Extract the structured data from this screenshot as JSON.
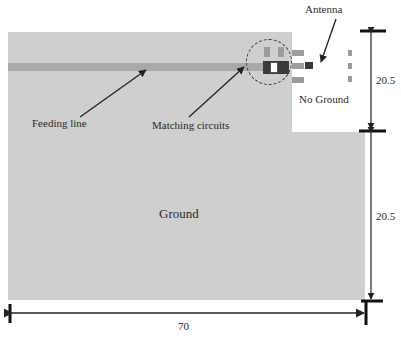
{
  "diagram": {
    "labels": {
      "antenna": "Antenna",
      "feeding_line": "Feeding line",
      "matching_circuits": "Matching circuits",
      "no_ground": "No Ground",
      "ground": "Ground"
    },
    "dimensions": {
      "width": "70",
      "upper_height": "20.5",
      "lower_height": "20.5"
    },
    "colors": {
      "ground": "#cfcfcf",
      "no_ground": "#ffffff",
      "feed_line": "#a9a9a9",
      "annotation": "#222222"
    }
  }
}
